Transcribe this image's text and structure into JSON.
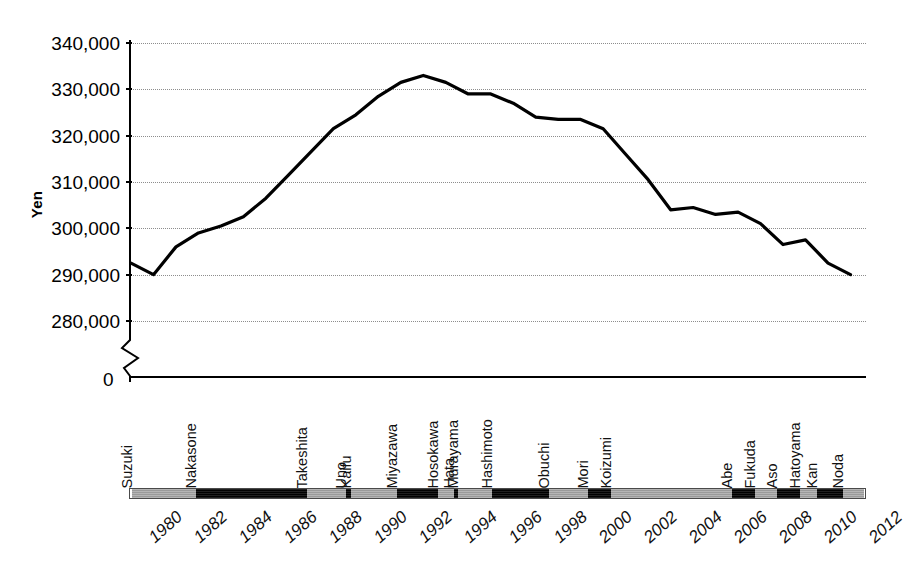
{
  "chart_data": {
    "type": "line",
    "title": "",
    "xlabel": "",
    "ylabel": "Yen",
    "ylim": [
      280000,
      340000
    ],
    "y_axis_break": true,
    "y_axis_break_note": "axis broken between 280,000 and 0",
    "grid": true,
    "legend": "none",
    "y_ticks": [
      "340,000",
      "330,000",
      "320,000",
      "310,000",
      "300,000",
      "290,000",
      "280,000",
      "0"
    ],
    "y_tick_values": [
      340000,
      330000,
      320000,
      310000,
      300000,
      290000,
      280000,
      0
    ],
    "x_ticks": [
      "1980",
      "1982",
      "1984",
      "1986",
      "1988",
      "1990",
      "1992",
      "1994",
      "1996",
      "1998",
      "2000",
      "2002",
      "2004",
      "2006",
      "2008",
      "2010",
      "2012"
    ],
    "x": [
      1980,
      1981,
      1982,
      1983,
      1984,
      1985,
      1986,
      1987,
      1988,
      1989,
      1990,
      1991,
      1992,
      1993,
      1994,
      1995,
      1996,
      1997,
      1998,
      1999,
      2000,
      2001,
      2002,
      2003,
      2004,
      2005,
      2006,
      2007,
      2008,
      2009,
      2010,
      2011,
      2012
    ],
    "values": [
      292500,
      290000,
      296000,
      299000,
      300500,
      302500,
      306500,
      311500,
      316500,
      321500,
      324500,
      328500,
      331500,
      333000,
      331500,
      329000,
      329000,
      327000,
      324000,
      323500,
      323500,
      321500,
      316000,
      310500,
      304000,
      304500,
      303000,
      303500,
      301000,
      296500,
      297500,
      292500,
      290000
    ],
    "series": [
      {
        "name": "Average monthly consumption expenditure",
        "values": [
          292500,
          290000,
          296000,
          299000,
          300500,
          302500,
          306500,
          311500,
          316500,
          321500,
          324500,
          328500,
          331500,
          333000,
          331500,
          329000,
          329000,
          327000,
          324000,
          323500,
          323500,
          321500,
          316000,
          310500,
          304000,
          304500,
          303000,
          303500,
          301000,
          296500,
          297500,
          292500,
          290000
        ]
      }
    ],
    "line_color": "#000000",
    "line_width": 3.2,
    "prime_ministers": [
      {
        "name": "Suzuki",
        "start": 1980.0,
        "end": 1982.85,
        "shade": "gray"
      },
      {
        "name": "Nakasone",
        "start": 1982.85,
        "end": 1987.8,
        "shade": "black"
      },
      {
        "name": "Takeshita",
        "start": 1987.8,
        "end": 1989.5,
        "shade": "gray"
      },
      {
        "name": "Uno",
        "start": 1989.5,
        "end": 1989.75,
        "shade": "black"
      },
      {
        "name": "Kaifu",
        "start": 1989.75,
        "end": 1991.8,
        "shade": "gray"
      },
      {
        "name": "Miyazawa",
        "start": 1991.8,
        "end": 1993.6,
        "shade": "black"
      },
      {
        "name": "Hosokawa",
        "start": 1993.6,
        "end": 1994.3,
        "shade": "gray"
      },
      {
        "name": "Hata",
        "start": 1994.3,
        "end": 1994.5,
        "shade": "black"
      },
      {
        "name": "Murayama",
        "start": 1994.5,
        "end": 1996.0,
        "shade": "gray"
      },
      {
        "name": "Hashimoto",
        "start": 1996.0,
        "end": 1998.55,
        "shade": "black"
      },
      {
        "name": "Obuchi",
        "start": 1998.55,
        "end": 2000.3,
        "shade": "gray"
      },
      {
        "name": "Mori",
        "start": 2000.3,
        "end": 2001.3,
        "shade": "black"
      },
      {
        "name": "Koizumi",
        "start": 2001.3,
        "end": 2006.7,
        "shade": "gray"
      },
      {
        "name": "Abe",
        "start": 2006.7,
        "end": 2007.7,
        "shade": "black"
      },
      {
        "name": "Fukuda",
        "start": 2007.7,
        "end": 2008.7,
        "shade": "gray"
      },
      {
        "name": "Aso",
        "start": 2008.7,
        "end": 2009.7,
        "shade": "black"
      },
      {
        "name": "Hatoyama",
        "start": 2009.7,
        "end": 2010.45,
        "shade": "gray"
      },
      {
        "name": "Kan",
        "start": 2010.45,
        "end": 2011.6,
        "shade": "black"
      },
      {
        "name": "Noda",
        "start": 2011.6,
        "end": 2012.55,
        "shade": "gray"
      }
    ]
  },
  "axis": {
    "y_title": "Yen",
    "zero_label": "0"
  },
  "colors": {
    "line": "#000000",
    "grid": "#8d8d8d",
    "axis": "#000000",
    "band_gray": "#a9a9a9",
    "band_black": "#111111",
    "background": "#ffffff"
  }
}
